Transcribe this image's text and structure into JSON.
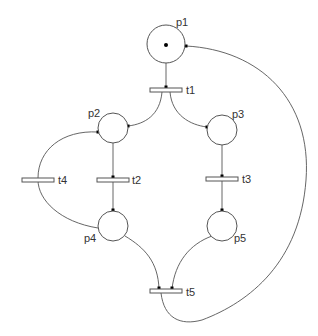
{
  "diagram": {
    "type": "petri-net",
    "places": [
      {
        "id": "p1",
        "label": "p1",
        "tokens": 1
      },
      {
        "id": "p2",
        "label": "p2",
        "tokens": 0
      },
      {
        "id": "p3",
        "label": "p3",
        "tokens": 0
      },
      {
        "id": "p4",
        "label": "p4",
        "tokens": 0
      },
      {
        "id": "p5",
        "label": "p5",
        "tokens": 0
      }
    ],
    "transitions": [
      {
        "id": "t1",
        "label": "t1"
      },
      {
        "id": "t2",
        "label": "t2"
      },
      {
        "id": "t3",
        "label": "t3"
      },
      {
        "id": "t4",
        "label": "t4"
      },
      {
        "id": "t5",
        "label": "t5"
      }
    ],
    "arcs": [
      {
        "from": "p1",
        "to": "t1"
      },
      {
        "from": "t1",
        "to": "p2"
      },
      {
        "from": "t1",
        "to": "p3"
      },
      {
        "from": "p2",
        "to": "t2"
      },
      {
        "from": "t2",
        "to": "p4"
      },
      {
        "from": "p3",
        "to": "t3"
      },
      {
        "from": "t3",
        "to": "p5"
      },
      {
        "from": "p4",
        "to": "t4"
      },
      {
        "from": "t4",
        "to": "p2"
      },
      {
        "from": "p4",
        "to": "t5"
      },
      {
        "from": "p5",
        "to": "t5"
      },
      {
        "from": "t5",
        "to": "p1"
      }
    ],
    "colors": {
      "stroke": "#555555",
      "token": "#000000",
      "background": "#ffffff"
    }
  }
}
